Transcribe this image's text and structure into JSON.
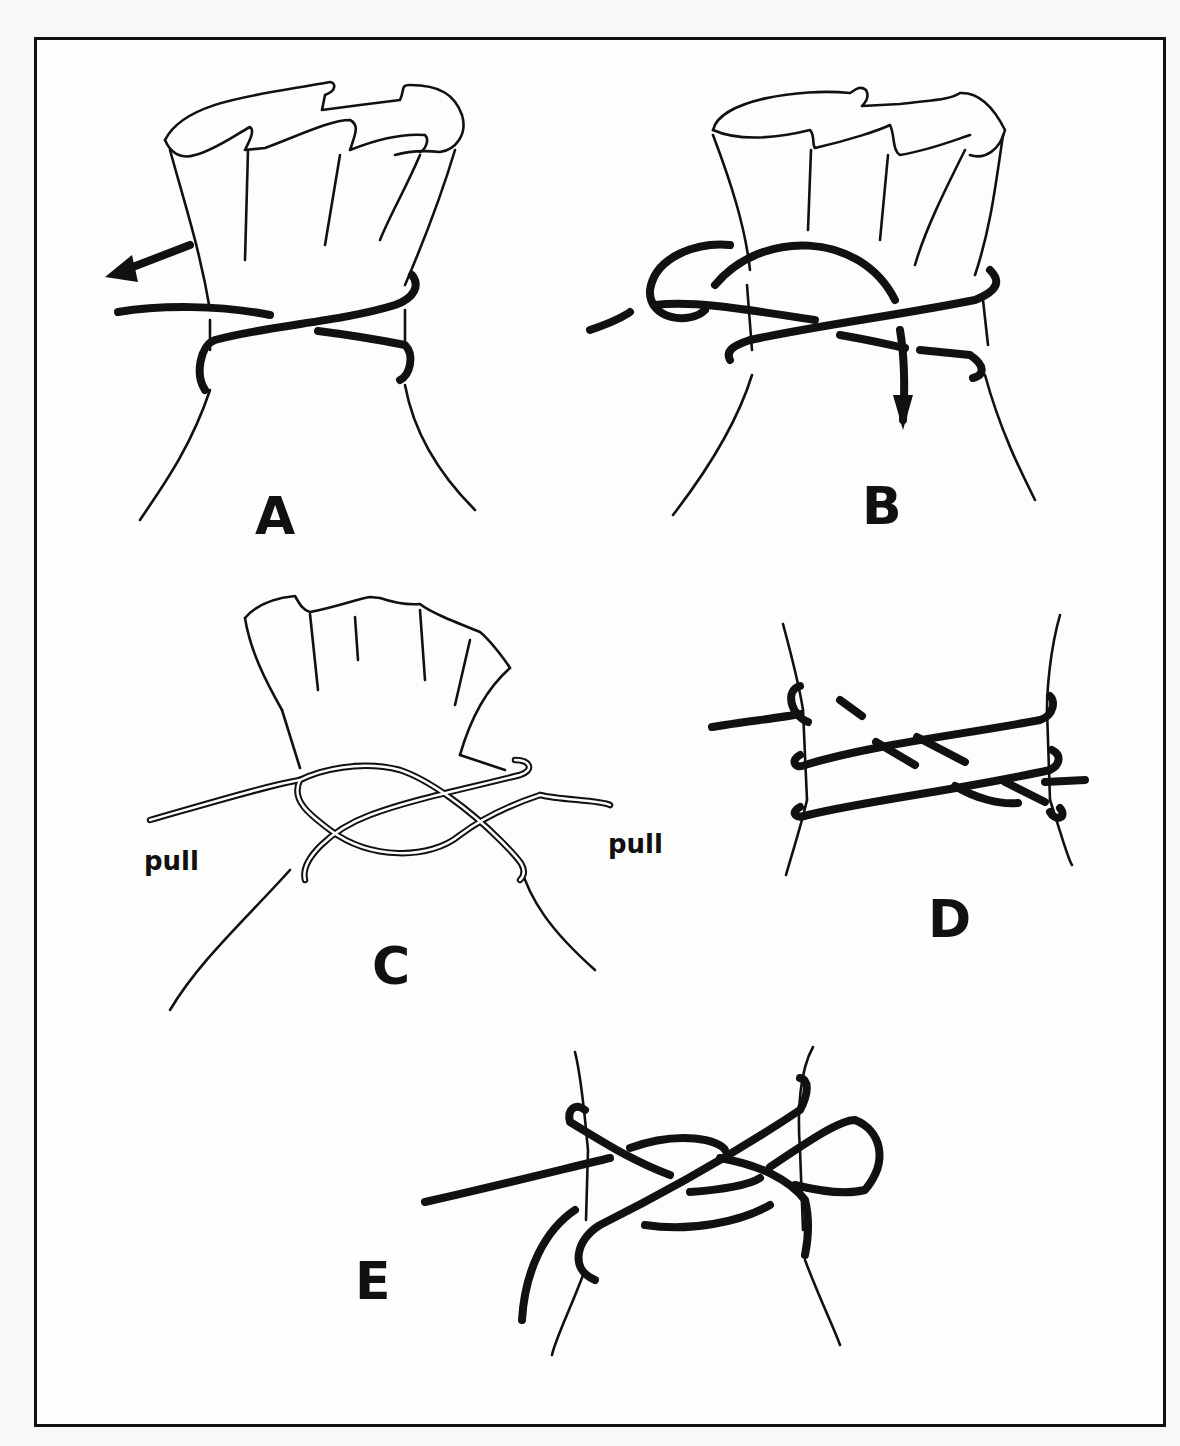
{
  "figure": {
    "border_color": "#111111",
    "background_color": "#fdfdfc",
    "panels": [
      {
        "id": "A",
        "label": "A",
        "description": "Sack neck with cord wrapped around; arrow pulling end to the left"
      },
      {
        "id": "B",
        "label": "B",
        "description": "Cord looped over the standing part; arrow pointing down"
      },
      {
        "id": "C",
        "label": "C",
        "description": "Double cord crossed around neck with both ends pulled",
        "annotations": [
          "pull",
          "pull"
        ]
      },
      {
        "id": "D",
        "label": "D",
        "description": "Close-up of cord wraps with extra turn"
      },
      {
        "id": "E",
        "label": "E",
        "description": "Knot tied with a slipped loop (bow) on the right"
      }
    ]
  }
}
